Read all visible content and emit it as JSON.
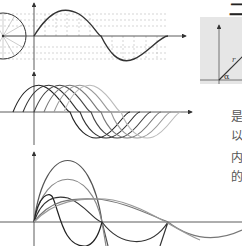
{
  "page": {
    "header_glyph": "二",
    "side_text": [
      "是",
      "以",
      "内",
      "的"
    ]
  },
  "inset": {
    "radius_label": "r",
    "angle_label": "α",
    "background": "#e6e6e6"
  },
  "diagrams": {
    "unit_circle_projection": {
      "description": "Sine wave generated by projecting a rotating radius of a circle",
      "circle_spokes": 12,
      "stroke": "#333333"
    },
    "phase_shifted_sines": {
      "description": "Family of sine waves with increasing phase shift",
      "count": 6,
      "stroke_shades": [
        "#222222",
        "#333333",
        "#444444",
        "#777777",
        "#999999",
        "#bbbbbb"
      ]
    },
    "harmonics": {
      "description": "Sine harmonics of differing amplitudes and frequencies starting at origin",
      "count": 6
    }
  }
}
